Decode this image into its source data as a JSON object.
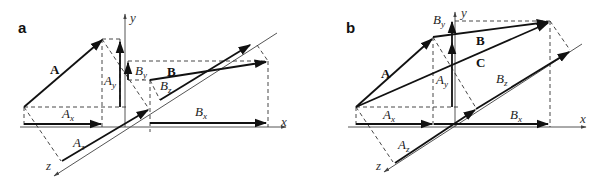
{
  "panels": [
    {
      "id": "a",
      "label": "a",
      "axes": {
        "x": "x",
        "y": "y",
        "z": "z"
      },
      "vectors": [
        {
          "name": "A",
          "label": "A"
        },
        {
          "name": "B",
          "label": "B"
        }
      ],
      "components": [
        {
          "base": "A",
          "sub": "x"
        },
        {
          "base": "A",
          "sub": "y"
        },
        {
          "base": "A",
          "sub": "z"
        },
        {
          "base": "B",
          "sub": "x"
        },
        {
          "base": "B",
          "sub": "y"
        },
        {
          "base": "B",
          "sub": "z"
        }
      ]
    },
    {
      "id": "b",
      "label": "b",
      "axes": {
        "x": "x",
        "y": "y",
        "z": "z"
      },
      "vectors": [
        {
          "name": "A",
          "label": "A"
        },
        {
          "name": "B",
          "label": "B"
        },
        {
          "name": "C",
          "label": "C"
        }
      ],
      "components": [
        {
          "base": "A",
          "sub": "x"
        },
        {
          "base": "A",
          "sub": "y"
        },
        {
          "base": "A",
          "sub": "z"
        },
        {
          "base": "B",
          "sub": "x"
        },
        {
          "base": "B",
          "sub": "y"
        },
        {
          "base": "B",
          "sub": "z"
        }
      ]
    }
  ],
  "colors": {
    "ink": "#111111",
    "axis": "#555555",
    "background": "#ffffff"
  }
}
